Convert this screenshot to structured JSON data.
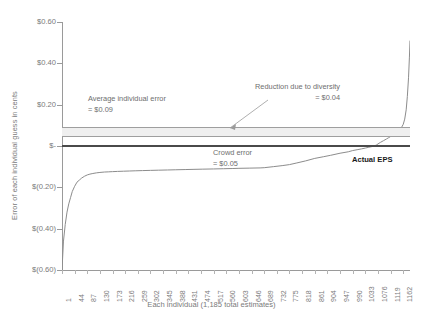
{
  "chart_data": {
    "type": "line",
    "title": "",
    "xlabel": "Each individual (1,185 total estimates)",
    "ylabel": "Error of each individual guess in cents",
    "grid": false,
    "legend": "none",
    "xlim": [
      1,
      1185
    ],
    "ylim": [
      -0.6,
      0.6
    ],
    "y_tick_labels": [
      "$0.60",
      "$0.40",
      "$0.20",
      "$-",
      "$(0.20)",
      "$(0.40)",
      "$(0.60)"
    ],
    "y_tick_values": [
      0.6,
      0.4,
      0.2,
      0.0,
      -0.2,
      -0.4,
      -0.6
    ],
    "x_tick_labels": [
      "1",
      "44",
      "87",
      "130",
      "173",
      "216",
      "259",
      "302",
      "345",
      "388",
      "431",
      "474",
      "517",
      "560",
      "603",
      "646",
      "689",
      "732",
      "775",
      "818",
      "861",
      "904",
      "947",
      "990",
      "1033",
      "1076",
      "1119",
      "1162"
    ],
    "x_tick_values": [
      1,
      44,
      87,
      130,
      173,
      216,
      259,
      302,
      345,
      388,
      431,
      474,
      517,
      560,
      603,
      646,
      689,
      732,
      775,
      818,
      861,
      904,
      947,
      990,
      1033,
      1076,
      1119,
      1162
    ],
    "series": [
      {
        "name": "Error of each individual guess",
        "color": "#8c8c8c",
        "x": [
          1,
          6,
          12,
          18,
          24,
          30,
          36,
          44,
          52,
          60,
          68,
          78,
          87,
          96,
          106,
          118,
          130,
          145,
          160,
          173,
          190,
          210,
          230,
          250,
          275,
          302,
          330,
          360,
          388,
          420,
          450,
          480,
          517,
          550,
          580,
          603,
          640,
          675,
          689,
          720,
          750,
          775,
          800,
          830,
          861,
          890,
          915,
          947,
          975,
          990,
          1005,
          1020,
          1033,
          1045,
          1058,
          1070,
          1076,
          1085,
          1095,
          1105,
          1112,
          1119,
          1126,
          1133,
          1140,
          1146,
          1152,
          1157,
          1162,
          1167,
          1172,
          1176,
          1180,
          1183,
          1185
        ],
        "y": [
          -0.6,
          -0.46,
          -0.38,
          -0.32,
          -0.28,
          -0.25,
          -0.22,
          -0.195,
          -0.175,
          -0.165,
          -0.155,
          -0.146,
          -0.14,
          -0.136,
          -0.133,
          -0.13,
          -0.128,
          -0.126,
          -0.125,
          -0.124,
          -0.123,
          -0.122,
          -0.121,
          -0.12,
          -0.119,
          -0.118,
          -0.117,
          -0.116,
          -0.115,
          -0.114,
          -0.113,
          -0.112,
          -0.111,
          -0.11,
          -0.109,
          -0.108,
          -0.107,
          -0.106,
          -0.105,
          -0.1,
          -0.095,
          -0.09,
          -0.082,
          -0.072,
          -0.06,
          -0.052,
          -0.045,
          -0.035,
          -0.028,
          -0.022,
          -0.018,
          -0.014,
          -0.01,
          -0.006,
          -0.002,
          0.004,
          0.01,
          0.018,
          0.026,
          0.034,
          0.04,
          0.046,
          0.052,
          0.058,
          0.064,
          0.072,
          0.082,
          0.092,
          0.105,
          0.13,
          0.175,
          0.24,
          0.33,
          0.43,
          0.51
        ]
      }
    ],
    "reference_lines": [
      {
        "name": "average-individual-error",
        "value": 0.09,
        "color": "#9e9e9e",
        "label": "Average individual error",
        "value_label": "= $0.09"
      },
      {
        "name": "crowd-error",
        "value": 0.05,
        "color": "#9e9e9e",
        "label": "Crowd error",
        "value_label": "= $0.05"
      },
      {
        "name": "actual-eps",
        "value": 0.0,
        "color": "#4a4a4a",
        "label": "Actual EPS"
      }
    ],
    "shaded_band": {
      "name": "reduction-due-to-diversity",
      "from": 0.05,
      "to": 0.09,
      "color": "#efefef",
      "label": "Reduction due to diversity",
      "value_label": "= $0.04"
    },
    "annotations": [
      {
        "name": "average-individual-error",
        "line1": "Average individual error",
        "line2": "= $0.09"
      },
      {
        "name": "reduction-due-to-diversity",
        "line1": "Reduction due to diversity",
        "line2": "= $0.04"
      },
      {
        "name": "crowd-error",
        "line1": "Crowd error",
        "line2": "= $0.05"
      },
      {
        "name": "actual-eps",
        "line1": "Actual EPS"
      }
    ]
  }
}
